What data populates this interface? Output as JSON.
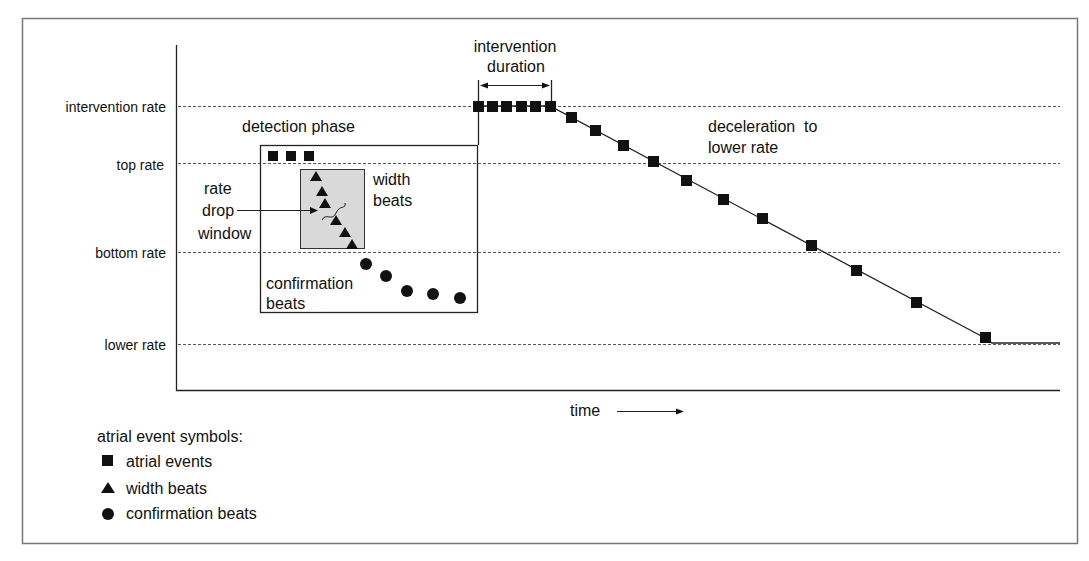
{
  "labels": {
    "y_axis": {
      "intervention_rate": "intervention  rate",
      "top_rate": "top rate",
      "bottom_rate": "bottom rate",
      "lower_rate": "lower rate"
    },
    "detection_phase": "detection phase",
    "rate_drop_window": [
      "rate",
      "drop",
      "window"
    ],
    "width_beats": [
      "width",
      "beats"
    ],
    "confirmation_beats": [
      "confirmation",
      "beats"
    ],
    "intervention_duration": [
      "intervention",
      "duration"
    ],
    "deceleration": [
      "deceleration  to",
      "lower rate"
    ],
    "x_axis": "time"
  },
  "legend": {
    "title": "atrial event symbols:",
    "items": [
      {
        "symbol": "square",
        "label": "atrial events"
      },
      {
        "symbol": "triangle",
        "label": "width beats"
      },
      {
        "symbol": "circle",
        "label": "confirmation beats"
      }
    ]
  },
  "colors": {
    "ink": "#111111",
    "frame": "#777777",
    "window_fill": "#d9d9d9",
    "grid": "#555555"
  }
}
